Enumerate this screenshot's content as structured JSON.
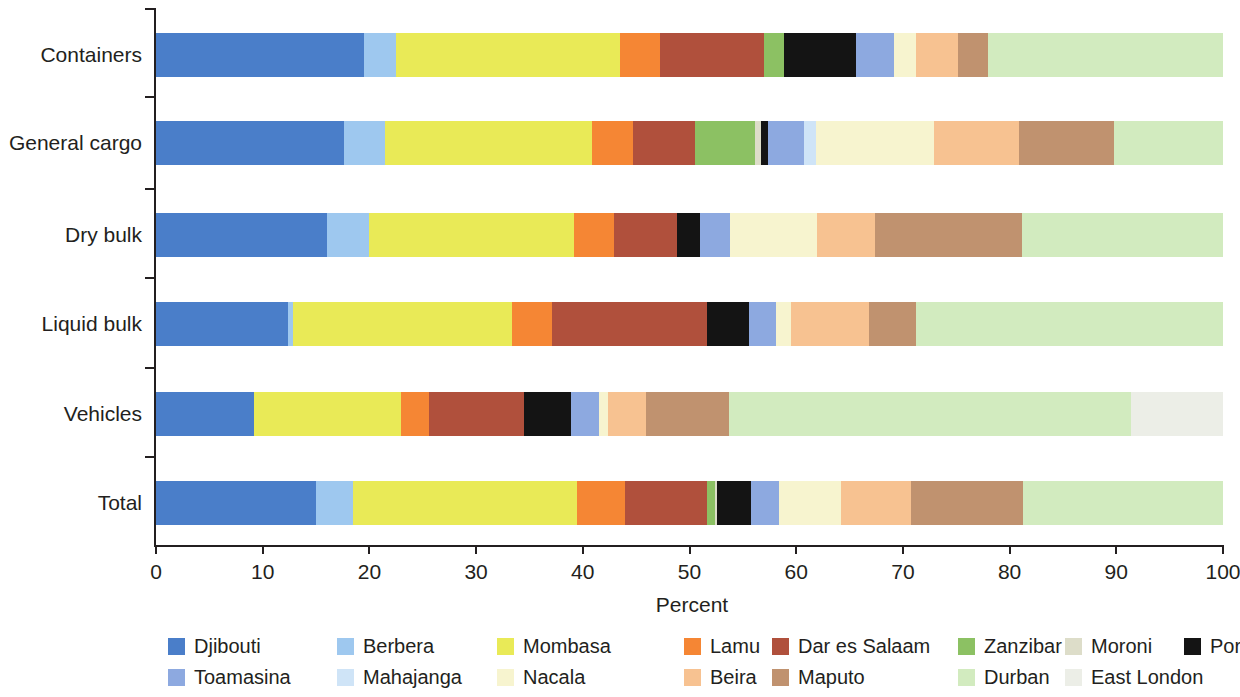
{
  "chart_data": {
    "type": "bar",
    "orientation": "horizontal",
    "stacked": true,
    "title": "",
    "xlabel": "Percent",
    "ylabel": "",
    "xlim": [
      0,
      100
    ],
    "xticks": [
      0,
      10,
      20,
      30,
      40,
      50,
      60,
      70,
      80,
      90,
      100
    ],
    "grid": false,
    "legend_position": "bottom",
    "categories": [
      "Containers",
      "General cargo",
      "Dry bulk",
      "Liquid bulk",
      "Vehicles",
      "Total"
    ],
    "series": [
      {
        "name": "Djibouti",
        "color": "#4a7ec9",
        "values": [
          19.5,
          17.6,
          16.0,
          12.4,
          9.2,
          15.0
        ]
      },
      {
        "name": "Berbera",
        "color": "#9ec8ef",
        "values": [
          3.0,
          3.9,
          4.0,
          0.4,
          0.0,
          3.5
        ]
      },
      {
        "name": "Mombasa",
        "color": "#e9ea57",
        "values": [
          21.0,
          19.4,
          19.2,
          20.6,
          13.8,
          21.0
        ]
      },
      {
        "name": "Lamu",
        "color": "#f58634",
        "values": [
          3.7,
          3.8,
          3.7,
          3.7,
          2.6,
          4.5
        ]
      },
      {
        "name": "Dar es Salaam",
        "color": "#b0503c",
        "values": [
          9.8,
          5.8,
          5.9,
          14.5,
          8.9,
          7.6
        ]
      },
      {
        "name": "Zanzibar",
        "color": "#8cc163",
        "values": [
          1.9,
          5.6,
          0.0,
          0.0,
          0.0,
          0.8
        ]
      },
      {
        "name": "Moroni",
        "color": "#ddddc9",
        "values": [
          0.0,
          0.6,
          0.0,
          0.0,
          0.0,
          0.2
        ]
      },
      {
        "name": "Port Louis",
        "color": "#141414",
        "values": [
          6.7,
          0.7,
          2.2,
          4.0,
          4.4,
          3.2
        ]
      },
      {
        "name": "Toamasina",
        "color": "#8da9e0",
        "values": [
          3.6,
          3.3,
          2.8,
          2.5,
          2.6,
          2.6
        ]
      },
      {
        "name": "Mahajanga",
        "color": "#cfe4f7",
        "values": [
          0.0,
          1.2,
          0.0,
          0.0,
          0.0,
          0.0
        ]
      },
      {
        "name": "Nacala",
        "color": "#f7f4cf",
        "values": [
          2.0,
          11.0,
          8.2,
          1.4,
          0.9,
          5.8
        ]
      },
      {
        "name": "Beira",
        "color": "#f7c291",
        "values": [
          4.0,
          8.0,
          5.4,
          7.3,
          3.5,
          6.6
        ]
      },
      {
        "name": "Maputo",
        "color": "#c0926f",
        "values": [
          2.8,
          8.9,
          13.8,
          4.4,
          7.8,
          10.5
        ]
      },
      {
        "name": "Durban",
        "color": "#d2ebbf",
        "values": [
          22.0,
          10.2,
          18.8,
          28.8,
          37.7,
          18.7
        ]
      },
      {
        "name": "East London",
        "color": "#eceee7",
        "values": [
          0.0,
          0.0,
          0.0,
          0.0,
          8.6,
          0.0
        ]
      }
    ]
  },
  "axis": {
    "x_title": "Percent",
    "tick_labels": [
      "0",
      "10",
      "20",
      "30",
      "40",
      "50",
      "60",
      "70",
      "80",
      "90",
      "100"
    ],
    "category_labels": [
      "Containers",
      "General cargo",
      "Dry bulk",
      "Liquid bulk",
      "Vehicles",
      "Total"
    ]
  },
  "legend": {
    "row1": [
      {
        "label": "Djibouti",
        "color": "#4a7ec9"
      },
      {
        "label": "Berbera",
        "color": "#9ec8ef"
      },
      {
        "label": "Mombasa",
        "color": "#e9ea57"
      },
      {
        "label": "Lamu",
        "color": "#f58634"
      },
      {
        "label": "Dar es Salaam",
        "color": "#b0503c"
      },
      {
        "label": "Zanzibar",
        "color": "#8cc163"
      },
      {
        "label": "Moroni",
        "color": "#ddddc9"
      },
      {
        "label": "Port Louis",
        "color": "#141414"
      }
    ],
    "row2": [
      {
        "label": "Toamasina",
        "color": "#8da9e0"
      },
      {
        "label": "Mahajanga",
        "color": "#cfe4f7"
      },
      {
        "label": "Nacala",
        "color": "#f7f4cf"
      },
      {
        "label": "Beira",
        "color": "#f7c291"
      },
      {
        "label": "Maputo",
        "color": "#c0926f"
      },
      {
        "label": "Durban",
        "color": "#d2ebbf"
      },
      {
        "label": "East London",
        "color": "#eceee7"
      }
    ]
  }
}
